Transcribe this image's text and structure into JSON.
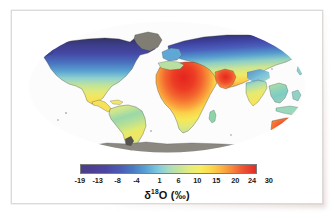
{
  "figure": {
    "kind": "world-map-choropleth",
    "background_color": "#ffffff",
    "card_color": "#ffffff",
    "border_color": "#dcdad6"
  },
  "map": {
    "projection": "mollweide",
    "ocean_color": "#ffffff",
    "globe_fill": "#fbfbfc",
    "nodata_color": "#8c8a80",
    "nodata_regions": [
      "Antarctica",
      "Greenland"
    ],
    "coastline_color": "#3a3a3a"
  },
  "legend": {
    "orientation": "horizontal",
    "tick_labels": [
      "-19",
      "-13",
      "-8",
      "-4",
      "1",
      "6",
      "10",
      "15",
      "20",
      "24",
      "30"
    ],
    "tick_positions_pct": [
      7.5,
      16.0,
      25.5,
      34.5,
      45.5,
      54.5,
      63.5,
      72.5,
      81.5,
      89.5,
      97.5
    ],
    "gradient_stops": [
      {
        "pos": 0,
        "color": "#4a3f8c"
      },
      {
        "pos": 6,
        "color": "#4b3f93"
      },
      {
        "pos": 14,
        "color": "#4c46a3"
      },
      {
        "pos": 22,
        "color": "#4b5ab4"
      },
      {
        "pos": 30,
        "color": "#4a7cc4"
      },
      {
        "pos": 37,
        "color": "#58a2d4"
      },
      {
        "pos": 44,
        "color": "#7ec9de"
      },
      {
        "pos": 50,
        "color": "#a8dcc0"
      },
      {
        "pos": 56,
        "color": "#c6e49a"
      },
      {
        "pos": 62,
        "color": "#e4ec7e"
      },
      {
        "pos": 68,
        "color": "#f6ee63"
      },
      {
        "pos": 74,
        "color": "#fbd94e"
      },
      {
        "pos": 80,
        "color": "#fbb543"
      },
      {
        "pos": 86,
        "color": "#f78a3c"
      },
      {
        "pos": 92,
        "color": "#ef5733"
      },
      {
        "pos": 100,
        "color": "#e12d28"
      }
    ],
    "axis_label_text": "O (‰)",
    "axis_label_delta": "δ",
    "axis_label_superscript": "18"
  },
  "chart_data": {
    "type": "heatmap",
    "title": "",
    "xlabel": "",
    "ylabel": "",
    "colorbar_label": "δ18O (‰)",
    "colorbar_ticks": [
      -19,
      -13,
      -8,
      -4,
      1,
      6,
      10,
      15,
      20,
      24,
      30
    ],
    "colorbar_range": [
      -19,
      30
    ],
    "units": "per mil (‰)",
    "variable": "delta-18-O",
    "projection": "mollweide",
    "grid": false,
    "legend_position": "bottom",
    "regions": [
      {
        "name": "Arctic Canada / Greenland",
        "value": -19,
        "color": "#2f2f4e"
      },
      {
        "name": "Northern Canada",
        "value": -15,
        "color": "#46409c"
      },
      {
        "name": "Northern Siberia",
        "value": -17,
        "color": "#3b3f96"
      },
      {
        "name": "Central Siberia",
        "value": -11,
        "color": "#4a62bb"
      },
      {
        "name": "Northern Europe",
        "value": -7,
        "color": "#5fa6d6"
      },
      {
        "name": "Central Europe",
        "value": -2,
        "color": "#a6dcc2"
      },
      {
        "name": "Western United States",
        "value": 2,
        "color": "#cfe79a"
      },
      {
        "name": "Central United States",
        "value": 4,
        "color": "#d9eb88"
      },
      {
        "name": "Mexico",
        "value": 12,
        "color": "#f9e25a"
      },
      {
        "name": "Central America",
        "value": 9,
        "color": "#ece96f"
      },
      {
        "name": "Amazon Basin",
        "value": 5,
        "color": "#bfe196"
      },
      {
        "name": "Eastern Brazil",
        "value": 13,
        "color": "#f7e158"
      },
      {
        "name": "Southern South America",
        "value": 6,
        "color": "#c9e58e"
      },
      {
        "name": "Sahara Desert",
        "value": 29,
        "color": "#e8332a"
      },
      {
        "name": "Sahel",
        "value": 24,
        "color": "#f4652f"
      },
      {
        "name": "Central Africa",
        "value": 13,
        "color": "#f6e155"
      },
      {
        "name": "East Africa",
        "value": 16,
        "color": "#fbc948"
      },
      {
        "name": "Southern Africa",
        "value": 14,
        "color": "#f8dd52"
      },
      {
        "name": "Arabian Peninsula",
        "value": 26,
        "color": "#ef4c2c"
      },
      {
        "name": "Central Asia",
        "value": 8,
        "color": "#e2ea78"
      },
      {
        "name": "Tibetan Plateau",
        "value": -6,
        "color": "#6fb9da"
      },
      {
        "name": "India",
        "value": 11,
        "color": "#f5e95f"
      },
      {
        "name": "Southeast Asia",
        "value": 3,
        "color": "#a9ddb9"
      },
      {
        "name": "Indonesia",
        "value": 2,
        "color": "#9ed8c4"
      },
      {
        "name": "Australia Interior",
        "value": 27,
        "color": "#ee4328"
      },
      {
        "name": "Australia Coast",
        "value": 21,
        "color": "#f78236"
      },
      {
        "name": "Antarctica",
        "value": null,
        "color": "#8c8a80"
      }
    ]
  }
}
